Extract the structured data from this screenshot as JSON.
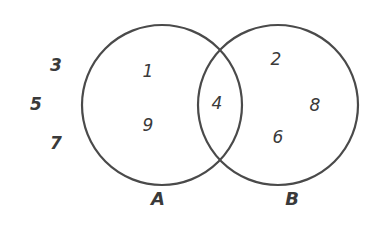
{
  "diagram": {
    "type": "venn",
    "stroke_color": "#4a4a4a",
    "text_color": "#3a3a3a",
    "sets": [
      {
        "name": "A",
        "label": "A"
      },
      {
        "name": "B",
        "label": "B"
      }
    ],
    "regions": {
      "outside": [
        "3",
        "5",
        "7"
      ],
      "a_only": [
        "1",
        "9"
      ],
      "a_and_b": [
        "4"
      ],
      "b_only": [
        "2",
        "8",
        "6"
      ]
    }
  }
}
